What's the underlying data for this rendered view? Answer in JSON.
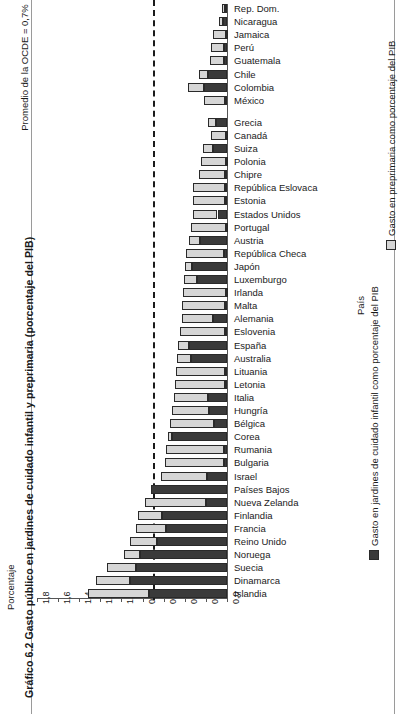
{
  "figure": {
    "title": "Gráfico 6.2  Gasto público en jardines de cuidado infantil y preprimaria (porcentaje del PIB)",
    "annotation": "Promedio de la OCDE = 0,7%"
  },
  "axes": {
    "value_axis_title": "Porcentaje",
    "category_axis_title": "País",
    "ticks": [
      "1,8",
      "1,6",
      "1,4",
      "1,2",
      "1,0",
      "0,8",
      "0,6",
      "0,4",
      "0,2",
      "0,0"
    ]
  },
  "legend": {
    "childcare": "Gasto en jardines de cuidado infantil como porcentaje del PIB",
    "preprimary": "Gasto en preprimaria como porcentaje del PIB"
  },
  "chart_data": {
    "type": "bar",
    "orientation": "horizontal-stacked",
    "title": "Gráfico 6.2  Gasto público en jardines de cuidado infantil y preprimaria (porcentaje del PIB)",
    "xlabel": "País",
    "ylabel": "Porcentaje",
    "ylim": [
      0.0,
      1.8
    ],
    "tick_values": [
      1.8,
      1.6,
      1.4,
      1.2,
      1.0,
      0.8,
      0.6,
      0.4,
      0.2,
      0.0
    ],
    "grid": false,
    "legend_position": "right",
    "reference_line": {
      "label": "Promedio de la OCDE = 0,7%",
      "value": 0.7
    },
    "series": [
      {
        "name": "Gasto en jardines de cuidado infantil como porcentaje del PIB",
        "color": "#3a3a3a"
      },
      {
        "name": "Gasto en preprimaria como porcentaje del PIB",
        "color": "#d6d6d6"
      }
    ],
    "categories": [
      "Rep. Dom.",
      "Nicaragua",
      "Jamaica",
      "Perú",
      "Guatemala",
      "Chile",
      "Colombia",
      "México",
      "Grecia",
      "Canadá",
      "Suiza",
      "Polonia",
      "Chipre",
      "República Eslovaca",
      "Estonia",
      "Estados Unidos",
      "Portugal",
      "Austria",
      "República Checa",
      "Japón",
      "Luxemburgo",
      "Irlanda",
      "Malta",
      "Alemania",
      "Eslovenia",
      "España",
      "Australia",
      "Lituania",
      "Letonia",
      "Italia",
      "Hungría",
      "Bélgica",
      "Corea",
      "Rumania",
      "Bulgaria",
      "Israel",
      "Países Bajos",
      "Nueva Zelanda",
      "Finlandia",
      "Francia",
      "Reino Unido",
      "Noruega",
      "Suecia",
      "Dinamarca",
      "Islandia"
    ],
    "childcare": [
      0.02,
      0.04,
      0.01,
      0.03,
      0.03,
      0.18,
      0.22,
      0.02,
      0.1,
      0.01,
      0.13,
      0.01,
      0.02,
      0.02,
      0.02,
      0.09,
      0.01,
      0.26,
      0.03,
      0.33,
      0.28,
      0.01,
      0.02,
      0.13,
      0.02,
      0.36,
      0.34,
      0.02,
      0.02,
      0.18,
      0.17,
      0.12,
      0.52,
      0.03,
      0.03,
      0.19,
      0.72,
      0.2,
      0.62,
      0.58,
      0.66,
      0.82,
      0.86,
      0.92,
      0.74
    ],
    "preprimary": [
      0.03,
      0.04,
      0.12,
      0.12,
      0.13,
      0.09,
      0.15,
      0.2,
      0.08,
      0.14,
      0.1,
      0.24,
      0.25,
      0.3,
      0.3,
      0.23,
      0.33,
      0.1,
      0.36,
      0.07,
      0.13,
      0.41,
      0.41,
      0.3,
      0.43,
      0.1,
      0.13,
      0.46,
      0.47,
      0.32,
      0.35,
      0.42,
      0.04,
      0.55,
      0.56,
      0.44,
      0.0,
      0.58,
      0.22,
      0.28,
      0.26,
      0.16,
      0.28,
      0.32,
      0.58
    ],
    "totals": [
      0.05,
      0.08,
      0.13,
      0.15,
      0.16,
      0.27,
      0.37,
      0.22,
      0.18,
      0.15,
      0.23,
      0.25,
      0.27,
      0.32,
      0.32,
      0.32,
      0.34,
      0.36,
      0.39,
      0.4,
      0.41,
      0.42,
      0.43,
      0.43,
      0.45,
      0.46,
      0.47,
      0.48,
      0.49,
      0.5,
      0.52,
      0.54,
      0.56,
      0.58,
      0.59,
      0.63,
      0.72,
      0.78,
      0.84,
      0.86,
      0.92,
      0.98,
      1.14,
      1.24,
      1.32
    ]
  }
}
